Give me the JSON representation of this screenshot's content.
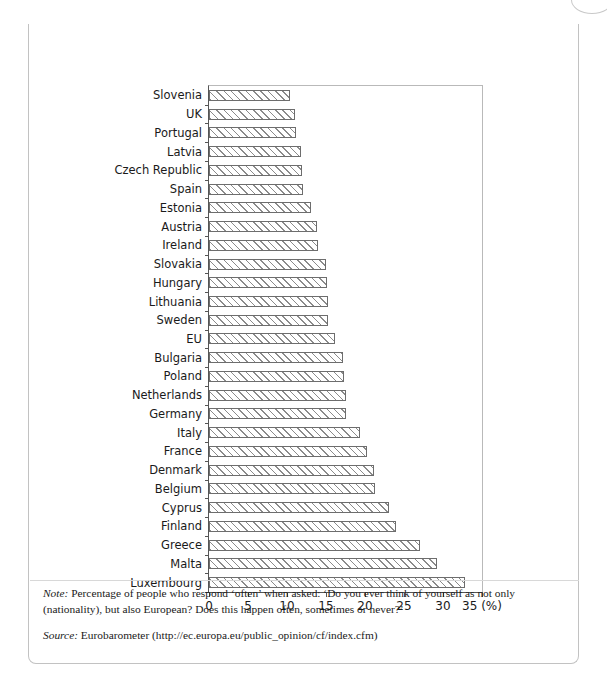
{
  "figure": {
    "number": "Figure 15.13",
    "title": "Feeling European?",
    "note_label": "Note:",
    "note_text": " Percentage of people who respond ‘often’ when asked: ‘Do you ever think of yourself as not only (nationality), but also European? Does this happen often, sometimes or never?’",
    "source_label": "Source:",
    "source_text": " Eurobarometer (http://ec.europa.eu/public_opinion/cf/index.cfm)"
  },
  "chart_data": {
    "type": "bar",
    "orientation": "horizontal",
    "title": "Feeling European?",
    "xlabel": "(%)",
    "ylabel": "",
    "xlim": [
      0,
      35
    ],
    "xticks": [
      0,
      5,
      10,
      15,
      20,
      25,
      30,
      35
    ],
    "xtick_labels": [
      "0",
      "5",
      "10",
      "15",
      "20",
      "25",
      "30",
      "35 (%)"
    ],
    "grid": false,
    "legend": "none",
    "unit": "(%)",
    "categories": [
      "Slovenia",
      "UK",
      "Portugal",
      "Latvia",
      "Czech Republic",
      "Spain",
      "Estonia",
      "Austria",
      "Ireland",
      "Slovakia",
      "Hungary",
      "Lithuania",
      "Sweden",
      "EU",
      "Bulgaria",
      "Poland",
      "Netherlands",
      "Germany",
      "Italy",
      "France",
      "Denmark",
      "Belgium",
      "Cyprus",
      "Finland",
      "Greece",
      "Malta",
      "Luxembourg"
    ],
    "values": [
      10.4,
      11.0,
      11.1,
      11.8,
      11.9,
      12.0,
      13.1,
      13.8,
      14.0,
      15.0,
      15.1,
      15.2,
      15.3,
      16.2,
      17.2,
      17.3,
      17.5,
      17.6,
      19.3,
      20.2,
      21.2,
      21.3,
      23.1,
      24.0,
      27.0,
      29.2,
      32.8
    ]
  }
}
